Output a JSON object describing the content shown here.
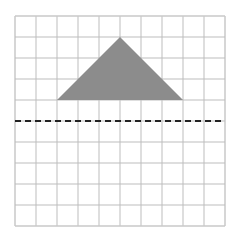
{
  "diagram": {
    "type": "grid-with-shape",
    "grid": {
      "columns": 10,
      "rows": 10,
      "origin_px": [
        15,
        16
      ],
      "cell_px": 21,
      "line_color": "#bdbdbd",
      "border_color": "#c8c8c8"
    },
    "shape": {
      "kind": "triangle",
      "vertices_grid": [
        [
          5,
          1
        ],
        [
          2,
          4
        ],
        [
          8,
          4
        ]
      ],
      "fill": "#8c8c8c"
    },
    "reflection_line": {
      "style": "dashed",
      "row": 5,
      "color": "#222222"
    }
  }
}
